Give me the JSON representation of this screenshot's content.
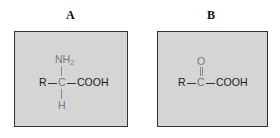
{
  "panels": [
    {
      "label": "A",
      "formula": {
        "r_group": "R",
        "center": "C",
        "right_group": "COOH",
        "top_group": "NH",
        "top_subscript": "2",
        "bottom_group": "H"
      }
    },
    {
      "label": "B",
      "formula": {
        "r_group": "R",
        "center": "C",
        "right_group": "COOH",
        "top_group": "O"
      }
    }
  ],
  "colors": {
    "box_fill": "#d5d5d5",
    "box_border": "#333333",
    "secondary_atoms": "#777777"
  }
}
